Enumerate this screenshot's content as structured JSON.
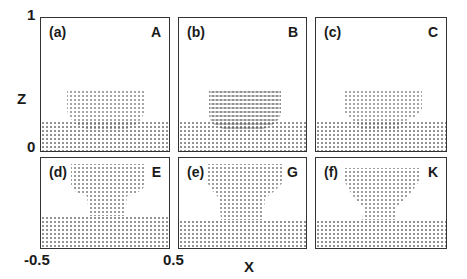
{
  "figure": {
    "y_axis": {
      "label": "Z",
      "ticks": [
        "1",
        "0"
      ]
    },
    "x_axis": {
      "label": "X",
      "ticks": [
        "-0.5",
        "0.5"
      ]
    },
    "panels": [
      {
        "id": "(a)",
        "corner": "A"
      },
      {
        "id": "(b)",
        "corner": "B"
      },
      {
        "id": "(c)",
        "corner": "C"
      },
      {
        "id": "(d)",
        "corner": "E"
      },
      {
        "id": "(e)",
        "corner": "G"
      },
      {
        "id": "(f)",
        "corner": "K"
      }
    ]
  }
}
